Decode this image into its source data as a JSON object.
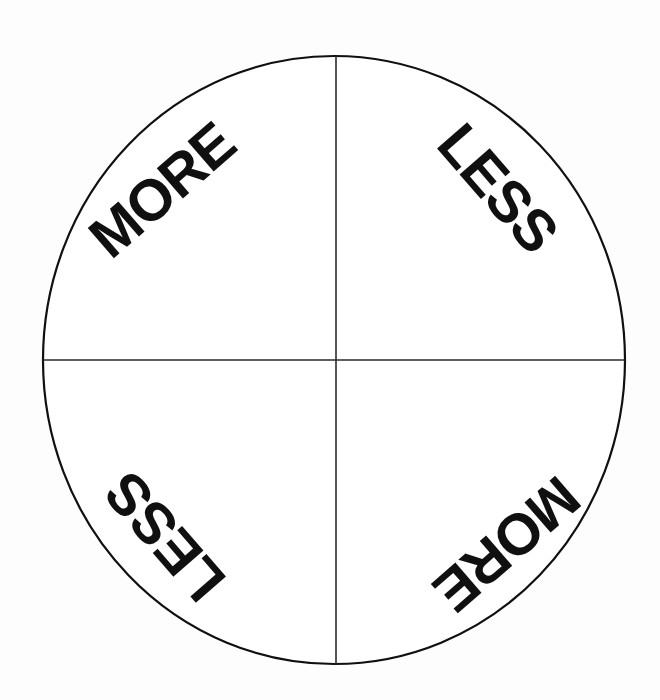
{
  "diagram": {
    "type": "quadrant-circle",
    "background_color": "#fdfdfd",
    "stroke_color": "#101010",
    "text_color": "#101010",
    "circle": {
      "center_x": 334,
      "center_y": 360,
      "radius_x": 291,
      "radius_y": 304,
      "stroke_width": 2
    },
    "axes": {
      "vertical_x": 336,
      "horizontal_y": 360,
      "stroke_width": 1.5
    },
    "quadrants": [
      {
        "position": "top-left",
        "label": "MORE",
        "rotation_deg": -41,
        "center_x": 162,
        "center_y": 190
      },
      {
        "position": "top-right",
        "label": "LESS",
        "rotation_deg": 49,
        "center_x": 498,
        "center_y": 188
      },
      {
        "position": "bottom-left",
        "label": "LESS",
        "rotation_deg": 229,
        "center_x": 165,
        "center_y": 537
      },
      {
        "position": "bottom-right",
        "label": "MORE",
        "rotation_deg": 139,
        "center_x": 507,
        "center_y": 544
      }
    ]
  }
}
